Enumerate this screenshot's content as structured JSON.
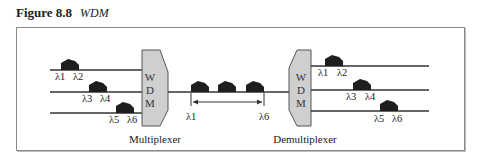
{
  "figure": {
    "number": "Figure 8.8",
    "title": "WDM"
  },
  "diagram": {
    "colors": {
      "line": "#333333",
      "pulse": "#1e1e1e",
      "device_fill": "#cfcfcf",
      "device_stroke": "#555555",
      "frame": "#8a8a8a"
    },
    "multiplexer": {
      "label": "Multiplexer",
      "block_letters": [
        "W",
        "D",
        "M"
      ]
    },
    "demultiplexer": {
      "label": "Demultiplexer",
      "block_letters": [
        "W",
        "D",
        "M"
      ]
    },
    "input_channels": [
      {
        "labels": [
          "λ1",
          "λ2"
        ]
      },
      {
        "labels": [
          "λ3",
          "λ4"
        ]
      },
      {
        "labels": [
          "λ5",
          "λ6"
        ]
      }
    ],
    "combined_link": {
      "pulse_count": 3,
      "range_start": "λ1",
      "range_end": "λ6"
    },
    "output_channels": [
      {
        "labels": [
          "λ1",
          "λ2"
        ]
      },
      {
        "labels": [
          "λ3",
          "λ4"
        ]
      },
      {
        "labels": [
          "λ5",
          "λ6"
        ]
      }
    ]
  }
}
